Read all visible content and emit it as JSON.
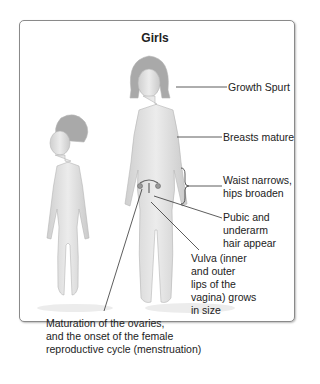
{
  "diagram": {
    "title": "Girls",
    "labels": {
      "growth_spurt": "Growth Spurt",
      "breasts": "Breasts mature",
      "waist_1": "Waist narrows,",
      "waist_2": "hips broaden",
      "pubic_1": "Pubic and",
      "pubic_2": "underarm",
      "pubic_3": "hair appear",
      "vulva_1": "Vulva (inner",
      "vulva_2": "and outer",
      "vulva_3": "lips of the",
      "vulva_4": "vagina) grows",
      "vulva_5": "in size",
      "ovaries_1": "Maturation of the ovaries,",
      "ovaries_2": "and the onset of the female",
      "ovaries_3": "reproductive cycle (menstruation)"
    },
    "figures": [
      "child-girl",
      "adolescent-girl"
    ]
  }
}
